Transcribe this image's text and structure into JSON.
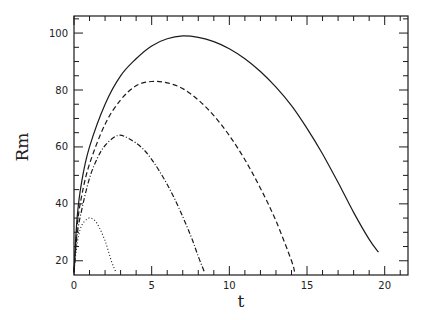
{
  "chart_data": {
    "type": "line",
    "title": "",
    "xlabel": "t",
    "ylabel": "Rm",
    "xlim": [
      0,
      21.5
    ],
    "ylim": [
      15,
      106
    ],
    "xticks": [
      0,
      5,
      10,
      15,
      20
    ],
    "xtick_labels": [
      "0",
      "5",
      "10",
      "15",
      "20"
    ],
    "yticks": [
      20,
      40,
      60,
      80,
      100
    ],
    "ytick_labels": [
      "20",
      "40",
      "60",
      "80",
      "100"
    ],
    "x_minor_step": 1,
    "y_minor_step": 5,
    "grid": false,
    "legend": null,
    "series": [
      {
        "name": "solid",
        "style": "solid",
        "x": [
          0,
          0.2,
          0.5,
          1,
          2,
          3,
          4,
          5,
          6,
          7,
          8,
          9,
          10,
          11,
          12,
          13,
          14,
          15,
          16,
          17,
          18,
          19,
          19.6
        ],
        "y": [
          16,
          35,
          48,
          60,
          75,
          85,
          91,
          95.5,
          98,
          99,
          98.5,
          97,
          94.5,
          91,
          86.5,
          81,
          74.5,
          66.5,
          57.5,
          47.5,
          37,
          27.5,
          23
        ]
      },
      {
        "name": "dashed",
        "style": "dashed",
        "x": [
          0,
          0.2,
          0.5,
          1,
          2,
          3,
          4,
          5,
          6,
          7,
          8,
          9,
          10,
          11,
          12,
          13,
          14,
          14.2
        ],
        "y": [
          16,
          32,
          43,
          54,
          68,
          76.5,
          81.5,
          83,
          82.5,
          80.5,
          76.5,
          71,
          64,
          55.5,
          45.5,
          34,
          20,
          16
        ]
      },
      {
        "name": "dash-dot",
        "style": "dashdot",
        "x": [
          0,
          0.2,
          0.5,
          1,
          1.5,
          2,
          2.8,
          3.5,
          4.5,
          5.5,
          6.5,
          7.5,
          8,
          8.4
        ],
        "y": [
          16,
          29,
          38,
          49,
          56,
          60.5,
          64,
          63,
          59,
          51.5,
          41.5,
          29,
          21.5,
          16
        ]
      },
      {
        "name": "dotted",
        "style": "dotted",
        "x": [
          0,
          0.15,
          0.3,
          0.5,
          0.8,
          1.1,
          1.5,
          2,
          2.4,
          2.7
        ],
        "y": [
          16,
          24,
          29,
          32.5,
          34.5,
          35,
          33,
          27,
          20,
          16
        ]
      }
    ]
  },
  "colors": {
    "ink": "#1a1a1a",
    "background": "#ffffff"
  }
}
